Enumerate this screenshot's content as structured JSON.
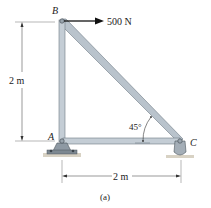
{
  "figure": {
    "caption": "(a)",
    "points": {
      "B": "B",
      "A": "A",
      "C": "C"
    },
    "load": {
      "label": "500 N",
      "direction": "right",
      "applied_at": "B"
    },
    "dimensions": {
      "vertical": "2 m",
      "horizontal": "2 m"
    },
    "angle": {
      "label": "45°",
      "at": "C"
    },
    "colors": {
      "member": "#b9c3cc",
      "member_edge": "#6f7a84",
      "support": "#8e99a3",
      "ground": "#d8d2c4",
      "dim_line": "#555555",
      "arrow": "#111111"
    }
  }
}
